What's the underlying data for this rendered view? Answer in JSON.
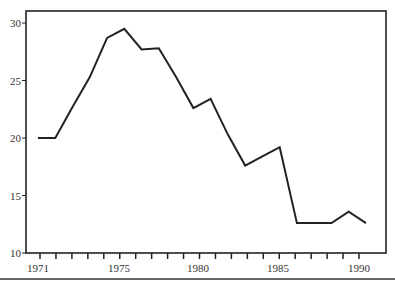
{
  "chart_data": {
    "type": "line",
    "title": "",
    "xlabel": "",
    "ylabel": "",
    "x": [
      1971,
      1972,
      1973,
      1974,
      1975,
      1976,
      1977,
      1978,
      1979,
      1980,
      1981,
      1982,
      1983,
      1984,
      1985,
      1986,
      1987,
      1988,
      1989,
      1990
    ],
    "series": [
      {
        "name": "",
        "values": [
          20.0,
          20.0,
          22.7,
          25.3,
          28.7,
          29.5,
          27.7,
          27.8,
          25.3,
          22.6,
          23.4,
          20.3,
          17.6,
          18.4,
          19.2,
          12.6,
          12.6,
          12.6,
          13.6,
          12.6
        ],
        "color": "#222222"
      }
    ],
    "ylim": [
      10,
      30
    ],
    "y_ticks": [
      10,
      15,
      20,
      25,
      30
    ],
    "x_tick_labels": [
      "1971",
      "1975",
      "1980",
      "1985",
      "1990"
    ],
    "grid": false,
    "legend": "none",
    "frame": "box"
  },
  "axis": {
    "y_labels": [
      "30",
      "25",
      "20",
      "15",
      "10"
    ],
    "x_labels": [
      "1971",
      "1975",
      "1980",
      "1985",
      "1990"
    ]
  }
}
